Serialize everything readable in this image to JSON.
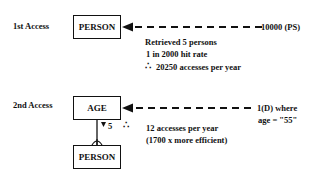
{
  "access1": {
    "label": "1st Access",
    "entity": "PERSON",
    "source": "10000 (PS)",
    "notes": [
      "Retrieved 5 persons",
      "1 in 2000 hit rate",
      "20250 accesses per year"
    ],
    "therefore_symbol": "∴"
  },
  "access2": {
    "label": "2nd Access",
    "entity_top": "AGE",
    "entity_bottom": "PERSON",
    "source_line1": "1(D) where",
    "source_line2": "age = \"55\"",
    "cardinality": "5",
    "therefore_symbol": "∴",
    "notes": [
      "12 accesses per year",
      "(1700 x more efficient)"
    ]
  },
  "colors": {
    "line": "#111111",
    "background": "#ffffff"
  }
}
